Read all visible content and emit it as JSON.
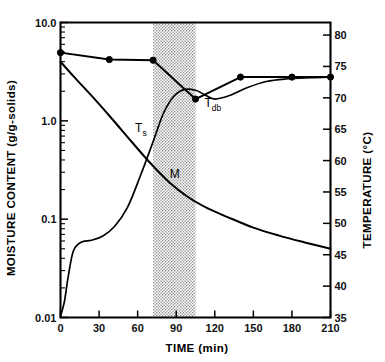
{
  "chart_data": {
    "type": "line",
    "title": "",
    "xlabel": "TIME  (min)",
    "ylabel": "MOISTURE  CONTENT  (g/g-solids)",
    "y2label": "TEMPERATURE  (°C)",
    "xlim": [
      0,
      210
    ],
    "ylim": [
      0.01,
      10.0
    ],
    "y2lim": [
      35,
      82
    ],
    "yscale": "log",
    "grid": false,
    "legend": "inline-annotations",
    "xticks": [
      0,
      30,
      60,
      90,
      120,
      150,
      180,
      210
    ],
    "xticklabels": [
      "0",
      "30",
      "60",
      "90",
      "120",
      "150",
      "180",
      "210"
    ],
    "yticks": [
      0.01,
      0.1,
      1.0,
      10.0
    ],
    "yticklabels": [
      "0.01",
      "0.1",
      "1.0",
      "10.0"
    ],
    "y2ticks": [
      35,
      40,
      45,
      50,
      55,
      60,
      65,
      70,
      75,
      80
    ],
    "y2ticklabels": [
      "35",
      "40",
      "45",
      "50",
      "55",
      "60",
      "65",
      "70",
      "75",
      "80"
    ],
    "shaded_region": {
      "label": "",
      "x_start": 72,
      "x_end": 105,
      "color": "#d0d0d0"
    },
    "series": [
      {
        "name": "Tdb",
        "label": "T_db",
        "axis": "right",
        "units": "°C",
        "markers": true,
        "x": [
          0,
          38,
          72,
          105,
          140,
          180,
          210
        ],
        "values": [
          77.2,
          76.1,
          76.0,
          69.8,
          73.3,
          73.3,
          73.3
        ]
      },
      {
        "name": "Ts",
        "label": "T_s",
        "axis": "right",
        "units": "°C",
        "markers": false,
        "x": [
          0,
          3,
          6,
          10,
          16,
          24,
          33,
          42,
          52,
          62,
          72,
          80,
          88,
          96,
          105,
          112,
          120,
          132,
          145,
          160,
          175,
          195,
          210
        ],
        "values": [
          35.2,
          37.5,
          41.5,
          45.6,
          47.0,
          47.3,
          48.0,
          49.5,
          52.5,
          57.5,
          63.0,
          67.5,
          70.2,
          71.3,
          71.2,
          70.5,
          69.8,
          70.4,
          71.6,
          72.6,
          73.0,
          73.2,
          73.3
        ]
      },
      {
        "name": "M",
        "label": "M",
        "axis": "left",
        "units": "g/g-solids",
        "markers": false,
        "x": [
          0,
          10,
          25,
          40,
          55,
          70,
          85,
          100,
          115,
          130,
          150,
          170,
          190,
          210
        ],
        "values": [
          4.0,
          2.85,
          1.75,
          1.05,
          0.62,
          0.37,
          0.235,
          0.165,
          0.128,
          0.105,
          0.082,
          0.068,
          0.058,
          0.05
        ]
      }
    ],
    "annotations": [
      {
        "text": "T",
        "sub": "db",
        "x": 112,
        "y2": 68.5
      },
      {
        "text": "T",
        "sub": "s",
        "x": 58,
        "y2": 64.5
      },
      {
        "text": "M",
        "sub": "",
        "x": 85,
        "y": 0.26
      }
    ]
  }
}
